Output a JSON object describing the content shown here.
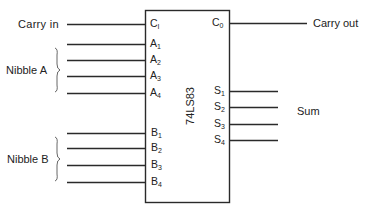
{
  "diagram": {
    "chip": {
      "name": "74LS83"
    },
    "inputs": {
      "carry_in": {
        "label": "Carry in",
        "pin": "C",
        "sub": "I"
      },
      "nibble_a": {
        "label": "Nibble A",
        "pins": [
          {
            "pin": "A",
            "sub": "1"
          },
          {
            "pin": "A",
            "sub": "2"
          },
          {
            "pin": "A",
            "sub": "3"
          },
          {
            "pin": "A",
            "sub": "4"
          }
        ]
      },
      "nibble_b": {
        "label": "Nibble B",
        "pins": [
          {
            "pin": "B",
            "sub": "1"
          },
          {
            "pin": "B",
            "sub": "2"
          },
          {
            "pin": "B",
            "sub": "3"
          },
          {
            "pin": "B",
            "sub": "4"
          }
        ]
      }
    },
    "outputs": {
      "carry_out": {
        "label": "Carry out",
        "pin": "C",
        "sub": "0"
      },
      "sum": {
        "label": "Sum",
        "pins": [
          {
            "pin": "S",
            "sub": "1"
          },
          {
            "pin": "S",
            "sub": "2"
          },
          {
            "pin": "S",
            "sub": "3"
          },
          {
            "pin": "S",
            "sub": "4"
          }
        ]
      }
    }
  }
}
